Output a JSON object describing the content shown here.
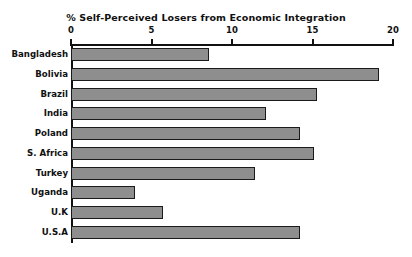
{
  "chart_data": {
    "type": "bar",
    "orientation": "horizontal",
    "title": "% Self-Perceived Losers from Economic Integration",
    "xlabel": "",
    "ylabel": "",
    "xlim": [
      0,
      20
    ],
    "xticks": [
      0,
      5,
      10,
      15,
      20
    ],
    "xtick_labels": [
      "0",
      "5",
      "10",
      "15",
      "20"
    ],
    "grid": false,
    "legend": false,
    "bar_color": "#8e8e8e",
    "bar_edge_color": "#1a1a1a",
    "axis_color": "#111111",
    "background": "#ffffff",
    "categories": [
      "Bangladesh",
      "Bolivia",
      "Brazil",
      "India",
      "Poland",
      "S. Africa",
      "Turkey",
      "Uganda",
      "U.K",
      "U.S.A"
    ],
    "values": [
      8.6,
      19.1,
      15.3,
      12.1,
      14.2,
      15.1,
      11.4,
      4.0,
      5.7,
      14.2
    ]
  }
}
